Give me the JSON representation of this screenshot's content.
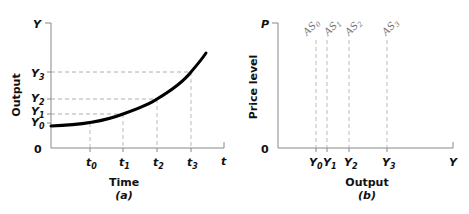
{
  "panel_a": {
    "y_axis_symbol": "Y",
    "x_axis_symbol": "t",
    "origin": "0",
    "y_axis_title": "Output",
    "x_axis_title": "Time",
    "caption": "(a)",
    "y_ticks": [
      {
        "base": "Y",
        "sub": "0"
      },
      {
        "base": "Y",
        "sub": "1"
      },
      {
        "base": "Y",
        "sub": "2"
      },
      {
        "base": "Y",
        "sub": "3"
      }
    ],
    "x_ticks": [
      {
        "base": "t",
        "sub": "0"
      },
      {
        "base": "t",
        "sub": "1"
      },
      {
        "base": "t",
        "sub": "2"
      },
      {
        "base": "t",
        "sub": "3"
      }
    ]
  },
  "panel_b": {
    "y_axis_symbol": "P",
    "x_axis_symbol": "Y",
    "origin": "0",
    "y_axis_title": "Price level",
    "x_axis_title": "Output",
    "caption": "(b)",
    "x_ticks": [
      {
        "base": "Y",
        "sub": "0"
      },
      {
        "base": "Y",
        "sub": "1"
      },
      {
        "base": "Y",
        "sub": "2"
      },
      {
        "base": "Y",
        "sub": "3"
      }
    ],
    "curves": [
      {
        "base": "AS",
        "sub": "0"
      },
      {
        "base": "AS",
        "sub": "1"
      },
      {
        "base": "AS",
        "sub": "2"
      },
      {
        "base": "AS",
        "sub": "3"
      }
    ]
  },
  "colors": {
    "axis": "#888888",
    "curve": "#000000",
    "guide": "#999999",
    "as_line": "#aaaaaa"
  }
}
